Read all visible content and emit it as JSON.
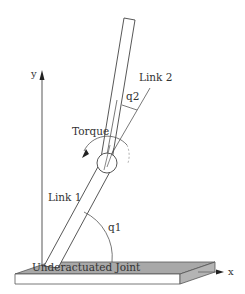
{
  "diagram": {
    "labels": {
      "y_axis": "y",
      "x_axis": "x",
      "link1": "Link 1",
      "link2": "Link 2",
      "q1": "q1",
      "q2": "q2",
      "torque": "Torque",
      "base_joint": "Underactuated Joint"
    },
    "colors": {
      "stroke": "#444444",
      "platform_top": "#a8a8a8",
      "platform_front": "#ffffff",
      "platform_side": "#b4b4b4",
      "axis": "#555555",
      "text": "#333333"
    }
  }
}
